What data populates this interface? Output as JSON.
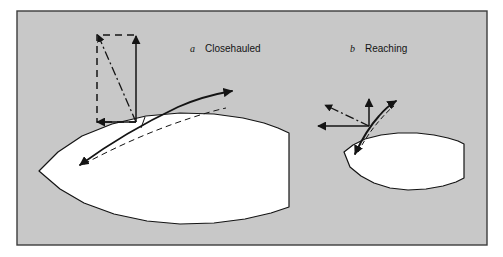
{
  "figure": {
    "background_color": "#ffffff",
    "panel_fill": "#c8c8c8",
    "panel_border_color": "#3c3c3c",
    "hull_fill": "#ffffff",
    "line_color": "#141414",
    "panel_rect": {
      "x": 17,
      "y": 11,
      "width": 470,
      "height": 234
    }
  },
  "panels": [
    {
      "id": "closehauled",
      "letter": "a",
      "label": "Closehauled",
      "letter_pos": {
        "x": 190,
        "y": 52
      },
      "label_pos": {
        "x": 205,
        "y": 52
      },
      "hull": {
        "name": "large-hull",
        "path": "M 39 171 L 58 152 L 82 136 L 112 124 L 146 116 L 180 113 L 214 114 L 243 118 L 264 123 L 278 128 L 289 133 L 289 207 L 271 213 L 245 219 L 214 223 L 180 224 L 147 221 L 114 214 L 84 203 L 60 189 Z"
      },
      "sail": {
        "name": "sail-curve",
        "path": "M 80 165 C 106 146 140 125 178 107 C 196 99 215 94 232 91",
        "arrow_start": {
          "x": 80,
          "y": 165,
          "angle": 217
        },
        "arrow_end": {
          "x": 232,
          "y": 91,
          "angle": 350
        }
      },
      "centerline": {
        "name": "hull-centerline",
        "path": "M 84 164 C 110 150 142 135 176 123 C 196 116 212 111 226 108"
      },
      "mast_tick": {
        "x1": 145,
        "y1": 117,
        "x2": 141,
        "y2": 128
      },
      "vector_origin": {
        "x": 136,
        "y": 122
      },
      "vectors": [
        {
          "name": "total-aerodynamic-force-vector",
          "style": "dashdot",
          "from": {
            "x": 136,
            "y": 122
          },
          "to": {
            "x": 98,
            "y": 35
          },
          "arrow": true
        },
        {
          "name": "driving-force-vector",
          "style": "solid",
          "from": {
            "x": 136,
            "y": 122
          },
          "to": {
            "x": 97,
            "y": 122
          },
          "arrow": true
        },
        {
          "name": "heeling-force-vector",
          "style": "solid",
          "from": {
            "x": 136,
            "y": 122
          },
          "to": {
            "x": 136,
            "y": 36
          },
          "arrow": true
        }
      ],
      "parallelogram": {
        "name": "force-parallelogram",
        "style": "dashed",
        "points": [
          {
            "x": 136,
            "y": 122
          },
          {
            "x": 97,
            "y": 122
          },
          {
            "x": 97,
            "y": 35
          },
          {
            "x": 136,
            "y": 35
          }
        ]
      }
    },
    {
      "id": "reaching",
      "letter": "b",
      "label": "Reaching",
      "letter_pos": {
        "x": 350,
        "y": 52
      },
      "label_pos": {
        "x": 365,
        "y": 52
      },
      "hull": {
        "name": "small-hull",
        "path": "M 344 152 L 353 145 L 365 139 L 381 135 L 398 133 L 417 133 L 434 135 L 448 138 L 458 141 L 464 144 L 464 178 L 456 182 L 443 186 L 426 189 L 408 190 L 390 188 L 374 183 L 361 176 L 350 167 Z"
      },
      "sail": {
        "name": "sail-curve",
        "path": "M 355 154 C 361 141 369 127 379 116 C 385 109 391 104 396 101",
        "arrow_start": {
          "x": 355,
          "y": 154,
          "angle": 110
        },
        "arrow_end": {
          "x": 396,
          "y": 101,
          "angle": 320
        }
      },
      "centerline": {
        "name": "hull-centerline",
        "style": "dashed",
        "path": "M 358 152 C 364 141 371 130 380 120 C 385 114 390 109 394 106"
      },
      "vector_origin": {
        "x": 369,
        "y": 126
      },
      "vectors": [
        {
          "name": "total-aerodynamic-force-vector",
          "style": "dashdot",
          "from": {
            "x": 369,
            "y": 126
          },
          "to": {
            "x": 325,
            "y": 105
          },
          "arrow": true
        },
        {
          "name": "driving-force-vector",
          "style": "solid",
          "from": {
            "x": 369,
            "y": 126
          },
          "to": {
            "x": 318,
            "y": 126
          },
          "arrow": true
        },
        {
          "name": "heeling-force-vector",
          "style": "solid",
          "from": {
            "x": 369,
            "y": 126
          },
          "to": {
            "x": 369,
            "y": 99
          },
          "arrow": true
        }
      ]
    }
  ]
}
